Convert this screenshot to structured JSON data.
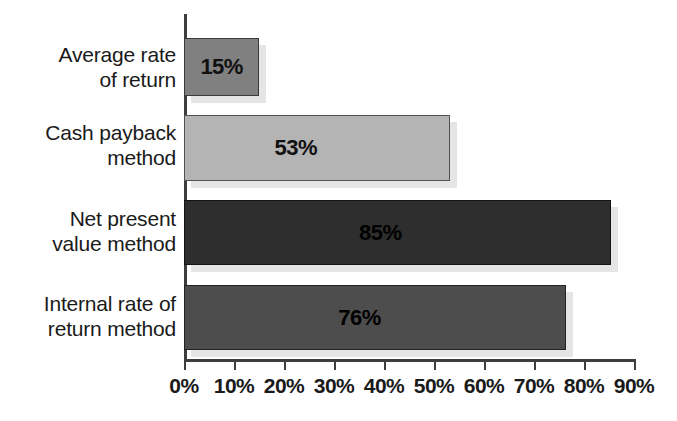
{
  "chart_data": {
    "type": "bar",
    "orientation": "horizontal",
    "title": "",
    "subtitle": "",
    "xlabel": "",
    "ylabel": "",
    "categories": [
      "Average rate\nof return",
      "Cash payback\nmethod",
      "Net present\nvalue method",
      "Internal rate of\nreturn method"
    ],
    "values": [
      15,
      53,
      85,
      76
    ],
    "value_labels": [
      "15%",
      "53%",
      "85%",
      "76%"
    ],
    "bar_colors": [
      "#808080",
      "#b4b4b4",
      "#2e2e2e",
      "#4d4d4d"
    ],
    "xlim": [
      0,
      90
    ],
    "xticks": [
      0,
      10,
      20,
      30,
      40,
      50,
      60,
      70,
      80,
      90
    ],
    "xtick_labels": [
      "0%",
      "10%",
      "20%",
      "30%",
      "40%",
      "50%",
      "60%",
      "70%",
      "80%",
      "90%"
    ],
    "grid": false,
    "legend": null,
    "axis_color": "#3d3d3d",
    "background": "#ffffff"
  },
  "axis": {
    "tick_labels": [
      "0%",
      "10%",
      "20%",
      "30%",
      "40%",
      "50%",
      "60%",
      "70%",
      "80%",
      "90%"
    ]
  },
  "bars": [
    {
      "label": "Average rate\nof return",
      "value": 15,
      "value_label": "15%",
      "color": "#808080"
    },
    {
      "label": "Cash payback\nmethod",
      "value": 53,
      "value_label": "53%",
      "color": "#b4b4b4"
    },
    {
      "label": "Net present\nvalue method",
      "value": 85,
      "value_label": "85%",
      "color": "#2e2e2e"
    },
    {
      "label": "Internal rate of\nreturn method",
      "value": 76,
      "value_label": "76%",
      "color": "#4d4d4d"
    }
  ]
}
